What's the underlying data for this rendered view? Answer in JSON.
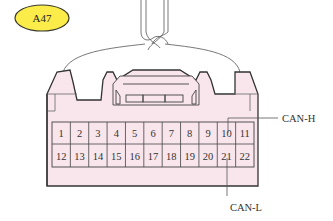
{
  "connector": {
    "id_label": "A47",
    "badge_color": "#fbec4a",
    "body_color": "#f8e6ec",
    "outline_color": "#333333",
    "pins_row1": [
      "1",
      "2",
      "3",
      "4",
      "5",
      "6",
      "7",
      "8",
      "9",
      "10",
      "11"
    ],
    "pins_row2": [
      "12",
      "13",
      "14",
      "15",
      "16",
      "17",
      "18",
      "19",
      "20",
      "21",
      "22"
    ]
  },
  "callouts": {
    "can_h": {
      "label": "CAN-H",
      "pin": "10"
    },
    "can_l": {
      "label": "CAN-L",
      "pin": "21"
    }
  }
}
